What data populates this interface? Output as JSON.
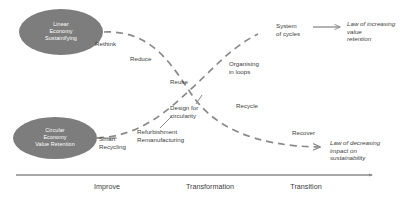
{
  "diagram": {
    "background_color": "#ffffff",
    "node_fill_color": "#7d7d7d",
    "node_text_color": "#ffffff",
    "curve_color": "#8a8a8a",
    "connector_color": "#8a8a8a",
    "axis_color": "#8a8a8a",
    "label_color": "#3d3d3d"
  },
  "nodes": [
    {
      "id": "linear-economy",
      "label": "Linear\nEconomy\nSustainifying",
      "position": "top-left"
    },
    {
      "id": "circular-economy",
      "label": "Circular\nEconomy\nValue Retention",
      "position": "bottom-left"
    }
  ],
  "descending_curve": {
    "name": "linear-economy-curve",
    "labels": [
      {
        "id": "rethink",
        "text": "Rethink"
      },
      {
        "id": "reduce",
        "text": "Reduce"
      },
      {
        "id": "reuse",
        "text": "Reuse"
      },
      {
        "id": "recycle",
        "text": "Recycle"
      },
      {
        "id": "recover",
        "text": "Recover"
      }
    ],
    "endpoint": "law-decreasing"
  },
  "ascending_curve": {
    "name": "circular-economy-curve",
    "labels": [
      {
        "id": "smart-recycling",
        "text": "Smart\nRecycling"
      },
      {
        "id": "refurbishment",
        "text": "Refurbishment\nRemanufacturing"
      },
      {
        "id": "design-circularity",
        "text": "Design for\ncircularity"
      },
      {
        "id": "organising-loops",
        "text": "Organising\nin loops"
      },
      {
        "id": "system-cycles",
        "text": "System\nof cycles"
      }
    ],
    "endpoint": "law-increasing"
  },
  "laws": [
    {
      "id": "law-increasing",
      "text": "Law of increasing\nvalue\nretention"
    },
    {
      "id": "law-decreasing",
      "text": "Law of decreasing\nimpact on\nsustainability"
    }
  ],
  "axis": {
    "name": "transition-axis",
    "stages": [
      {
        "id": "improve",
        "label": "Improve"
      },
      {
        "id": "transformation",
        "label": "Transformation"
      },
      {
        "id": "transition",
        "label": "Transition"
      }
    ]
  }
}
